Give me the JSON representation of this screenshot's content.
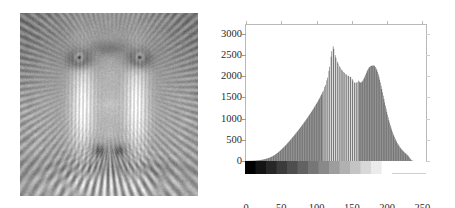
{
  "figure": {
    "left_image": {
      "name": "baboon-grayscale-photo",
      "alt": "Grayscale photograph of a mandrill (baboon) face"
    },
    "chart_data": {
      "type": "bar",
      "title": "",
      "subtitle": "",
      "xlabel": "",
      "ylabel": "",
      "grid": false,
      "legend": null,
      "xlim": [
        0,
        255
      ],
      "ylim": [
        0,
        3200
      ],
      "xticks": [
        0,
        50,
        100,
        150,
        200,
        250
      ],
      "xticklabels": [
        "0",
        "50",
        "100",
        "150",
        "200",
        "250"
      ],
      "yticks": [
        0,
        500,
        1000,
        1500,
        2000,
        2500,
        3000
      ],
      "yticklabels": [
        "0",
        "500",
        "1000",
        "1500",
        "2000",
        "2500",
        "3000"
      ],
      "bar_color": "#6e6e6e",
      "axis_color": "#b9b9b9",
      "text_color": "#2b2b2b",
      "colorbar": {
        "name": "grayscale-ramp",
        "from_value": 0,
        "to_value": 225,
        "from_color": "#000000",
        "to_color": "#ffffff"
      },
      "categories": [
        0,
        1,
        2,
        3,
        4,
        5,
        6,
        7,
        8,
        9,
        10,
        11,
        12,
        13,
        14,
        15,
        16,
        17,
        18,
        19,
        20,
        21,
        22,
        23,
        24,
        25,
        26,
        27,
        28,
        29,
        30,
        31,
        32,
        33,
        34,
        35,
        36,
        37,
        38,
        39,
        40,
        41,
        42,
        43,
        44,
        45,
        46,
        47,
        48,
        49,
        50,
        51,
        52,
        53,
        54,
        55,
        56,
        57,
        58,
        59,
        60,
        61,
        62,
        63,
        64,
        65,
        66,
        67,
        68,
        69,
        70,
        71,
        72,
        73,
        74,
        75,
        76,
        77,
        78,
        79,
        80,
        81,
        82,
        83,
        84,
        85,
        86,
        87,
        88,
        89,
        90,
        91,
        92,
        93,
        94,
        95,
        96,
        97,
        98,
        99,
        100,
        101,
        102,
        103,
        104,
        105,
        106,
        107,
        108,
        109,
        110,
        111,
        112,
        113,
        114,
        115,
        116,
        117,
        118,
        119,
        120,
        121,
        122,
        123,
        124,
        125,
        126,
        127,
        128,
        129,
        130,
        131,
        132,
        133,
        134,
        135,
        136,
        137,
        138,
        139,
        140,
        141,
        142,
        143,
        144,
        145,
        146,
        147,
        148,
        149,
        150,
        151,
        152,
        153,
        154,
        155,
        156,
        157,
        158,
        159,
        160,
        161,
        162,
        163,
        164,
        165,
        166,
        167,
        168,
        169,
        170,
        171,
        172,
        173,
        174,
        175,
        176,
        177,
        178,
        179,
        180,
        181,
        182,
        183,
        184,
        185,
        186,
        187,
        188,
        189,
        190,
        191,
        192,
        193,
        194,
        195,
        196,
        197,
        198,
        199,
        200,
        201,
        202,
        203,
        204,
        205,
        206,
        207,
        208,
        209,
        210,
        211,
        212,
        213,
        214,
        215,
        216,
        217,
        218,
        219,
        220,
        221,
        222,
        223,
        224,
        225,
        226,
        227,
        228,
        229,
        230,
        231,
        232,
        233,
        234,
        235,
        236,
        237,
        238,
        239,
        240,
        241,
        242,
        243,
        244,
        245,
        246,
        247,
        248,
        249,
        250,
        251,
        252,
        253,
        254,
        255
      ],
      "values": [
        2,
        3,
        3,
        4,
        4,
        5,
        6,
        6,
        7,
        8,
        9,
        10,
        11,
        12,
        14,
        15,
        17,
        18,
        20,
        22,
        24,
        27,
        30,
        33,
        36,
        40,
        44,
        48,
        52,
        57,
        62,
        68,
        74,
        80,
        87,
        95,
        103,
        112,
        121,
        131,
        141,
        152,
        164,
        176,
        189,
        202,
        216,
        230,
        245,
        260,
        276,
        292,
        308,
        325,
        342,
        359,
        377,
        395,
        413,
        431,
        450,
        469,
        488,
        507,
        527,
        547,
        567,
        587,
        607,
        627,
        648,
        669,
        690,
        711,
        732,
        754,
        776,
        798,
        820,
        842,
        865,
        888,
        911,
        934,
        957,
        981,
        1005,
        1029,
        1053,
        1078,
        1103,
        1128,
        1153,
        1179,
        1205,
        1231,
        1258,
        1285,
        1312,
        1340,
        1368,
        1397,
        1426,
        1456,
        1487,
        1519,
        1552,
        1586,
        1622,
        1660,
        1700,
        1743,
        1790,
        1841,
        1898,
        1962,
        2035,
        2120,
        2218,
        2330,
        2455,
        2585,
        2690,
        2700,
        2640,
        2560,
        2490,
        2430,
        2380,
        2335,
        2295,
        2260,
        2228,
        2200,
        2175,
        2152,
        2130,
        2110,
        2092,
        2075,
        2060,
        2046,
        2033,
        2021,
        2010,
        2000,
        1991,
        1983,
        1976,
        1970,
        1930,
        1895,
        1868,
        1850,
        1840,
        1838,
        1844,
        1856,
        1872,
        1890,
        1868,
        1852,
        1846,
        1852,
        1868,
        1892,
        1922,
        1956,
        1994,
        2034,
        2074,
        2112,
        2146,
        2176,
        2200,
        2218,
        2232,
        2240,
        2244,
        2246,
        2250,
        2244,
        2230,
        2208,
        2178,
        2140,
        2094,
        2040,
        1980,
        1914,
        1844,
        1770,
        1694,
        1616,
        1538,
        1460,
        1382,
        1306,
        1232,
        1160,
        1090,
        1024,
        960,
        900,
        842,
        788,
        736,
        688,
        642,
        600,
        560,
        522,
        487,
        454,
        423,
        394,
        367,
        342,
        318,
        296,
        275,
        256,
        238,
        221,
        205,
        190,
        175,
        160,
        145,
        128,
        108,
        86,
        62,
        40,
        22,
        10,
        4,
        2,
        1,
        0,
        0,
        0,
        0,
        0,
        0,
        0,
        0,
        0,
        0,
        0,
        0,
        0,
        0,
        0,
        0,
        0
      ],
      "missing_bins": [
        110,
        113,
        116,
        119,
        122,
        125,
        128,
        131,
        134,
        137,
        140,
        143,
        146,
        149,
        152,
        155,
        158
      ],
      "annotations": [
        {
          "label": "primary peak",
          "x": 118,
          "y": 2700
        },
        {
          "label": "secondary peak",
          "x": 180,
          "y": 2250
        }
      ]
    }
  }
}
